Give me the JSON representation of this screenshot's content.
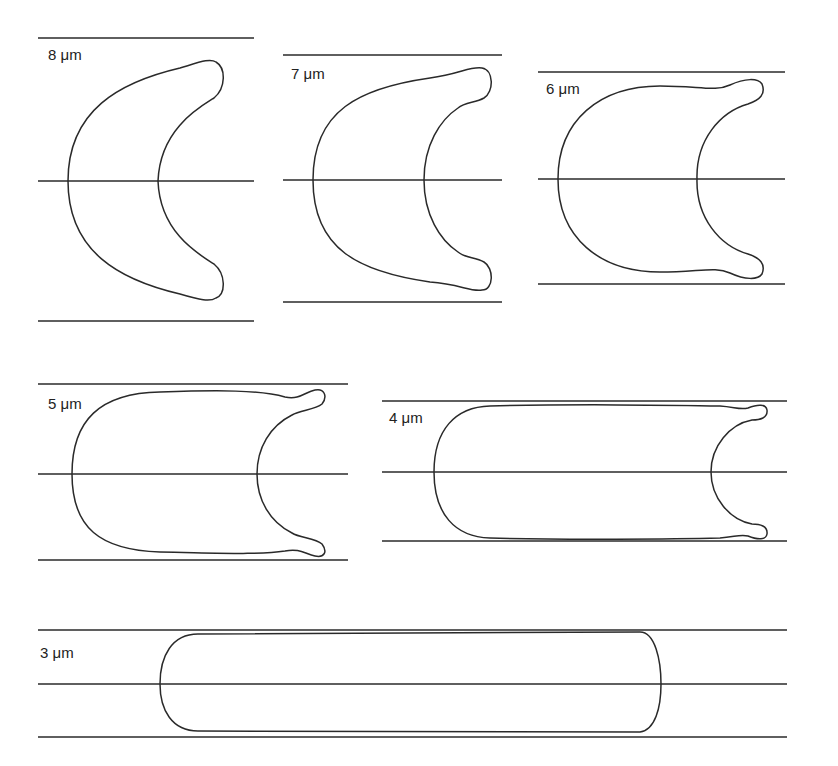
{
  "figure": {
    "panels": [
      {
        "label": "8 μm",
        "diameter_um": 8,
        "shape": "crescent"
      },
      {
        "label": "7 μm",
        "diameter_um": 7,
        "shape": "crescent"
      },
      {
        "label": "6 μm",
        "diameter_um": 6,
        "shape": "parachute"
      },
      {
        "label": "5 μm",
        "diameter_um": 5,
        "shape": "parachute"
      },
      {
        "label": "4 μm",
        "diameter_um": 4,
        "shape": "elongated-parachute"
      },
      {
        "label": "3 μm",
        "diameter_um": 3,
        "shape": "capsule"
      }
    ],
    "colors": {
      "line": "#2a2a2a",
      "background": "#ffffff"
    }
  }
}
